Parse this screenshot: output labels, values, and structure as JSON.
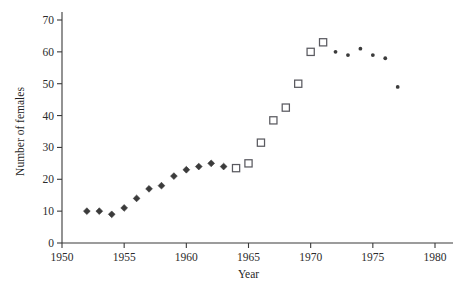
{
  "chart_data": {
    "type": "scatter",
    "title": "",
    "xlabel": "Year",
    "ylabel": "Number of females",
    "xlim": [
      1950,
      1980
    ],
    "ylim": [
      0,
      70
    ],
    "xticks": [
      1950,
      1955,
      1960,
      1965,
      1970,
      1975,
      1980
    ],
    "xtick_labels": [
      "1950",
      "1955",
      "1960",
      "1965",
      "1970",
      "1975",
      "1980"
    ],
    "yticks": [
      0,
      10,
      20,
      30,
      40,
      50,
      60,
      70
    ],
    "ytick_labels": [
      "0",
      "10",
      "20",
      "30",
      "40",
      "50",
      "60",
      "70"
    ],
    "grid": false,
    "legend": false,
    "series": [
      {
        "name": "filled-diamond",
        "marker": "diamond",
        "color": "#3b3b3b",
        "points": [
          {
            "x": 1952,
            "y": 10.0
          },
          {
            "x": 1953,
            "y": 10.0
          },
          {
            "x": 1954,
            "y": 9.0
          },
          {
            "x": 1955,
            "y": 11.0
          },
          {
            "x": 1956,
            "y": 14.0
          },
          {
            "x": 1957,
            "y": 17.0
          },
          {
            "x": 1958,
            "y": 18.0
          },
          {
            "x": 1959,
            "y": 21.0
          },
          {
            "x": 1960,
            "y": 23.0
          },
          {
            "x": 1961,
            "y": 24.0
          },
          {
            "x": 1962,
            "y": 25.0
          },
          {
            "x": 1963,
            "y": 24.0
          }
        ]
      },
      {
        "name": "open-square",
        "marker": "square",
        "color": "#5a5a60",
        "points": [
          {
            "x": 1964,
            "y": 23.5
          },
          {
            "x": 1965,
            "y": 25.0
          },
          {
            "x": 1966,
            "y": 31.5
          },
          {
            "x": 1967,
            "y": 38.5
          },
          {
            "x": 1968,
            "y": 42.5
          },
          {
            "x": 1969,
            "y": 50.0
          },
          {
            "x": 1970,
            "y": 60.0
          },
          {
            "x": 1971,
            "y": 63.0
          }
        ]
      },
      {
        "name": "small-dot",
        "marker": "dot",
        "color": "#3b3b3b",
        "points": [
          {
            "x": 1972,
            "y": 60.0
          },
          {
            "x": 1973,
            "y": 59.0
          },
          {
            "x": 1974,
            "y": 61.0
          },
          {
            "x": 1975,
            "y": 59.0
          },
          {
            "x": 1976,
            "y": 58.0
          },
          {
            "x": 1977,
            "y": 49.0
          }
        ]
      }
    ]
  }
}
